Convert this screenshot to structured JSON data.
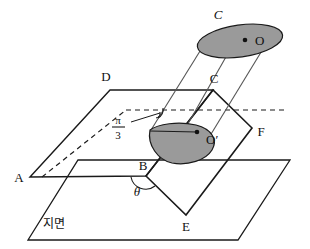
{
  "figure": {
    "type": "geometry-diagram",
    "colors": {
      "stroke": "#1a1a1a",
      "fill_shaded": "#9a9a9a",
      "background": "#ffffff"
    },
    "labels": {
      "top_circle": "C",
      "top_center": "O",
      "vertex_d": "D",
      "vertex_c": "C",
      "vertex_a": "A",
      "vertex_b": "B",
      "vertex_e": "E",
      "vertex_f": "F",
      "base_center": "O′",
      "ground": "지면",
      "angle_theta": "θ",
      "angle_pi_numerator": "π",
      "angle_pi_denominator": "3"
    },
    "annotations": {
      "pi_over_three": "π/3",
      "theta": "θ"
    }
  }
}
